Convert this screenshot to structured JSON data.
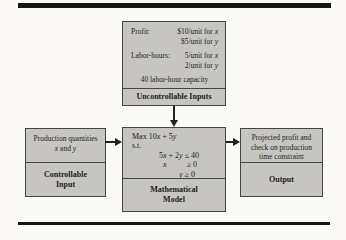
{
  "figure": {
    "uncontrollable": {
      "profit": {
        "label": "Profit:",
        "x_text": "$10/unit for ",
        "x_var": "x",
        "y_text": "$5/unit for ",
        "y_var": "y"
      },
      "labor": {
        "label": "Labor-hours:",
        "x_text": "5/unit for ",
        "x_var": "x",
        "y_text": "2/unit for ",
        "y_var": "y"
      },
      "capacity": "40 labor-hour capacity",
      "caption": "Uncontrollable Inputs"
    },
    "controllable": {
      "line1": "Production quantities",
      "var_x": "x",
      "mid": " and ",
      "var_y": "y",
      "caption_line1": "Controllable",
      "caption_line2": "Input"
    },
    "model": {
      "objective_pre": "Max 10",
      "objective_x": "x",
      "objective_mid": " + 5",
      "objective_y": "y",
      "st": "s.t.",
      "c1_pre": "5",
      "c1_x": "x",
      "c1_mid": " + 2",
      "c1_y": "y",
      "c1_post": " ≤ 40",
      "c2_var": "x",
      "c2_rel": "≥ 0",
      "c3_var": "y",
      "c3_rel": "≥ 0",
      "caption_line1": "Mathematical",
      "caption_line2": "Model"
    },
    "output": {
      "line1": "Projected profit and",
      "line2": "check on production",
      "line3": "time constraint",
      "caption": "Output"
    }
  },
  "colors": {
    "box_fill": "#c7c5c1",
    "box_border": "#454545",
    "bar": "#161616",
    "background": "#fbfaf7",
    "text": "#1c1c1c",
    "arrow": "#222222"
  }
}
